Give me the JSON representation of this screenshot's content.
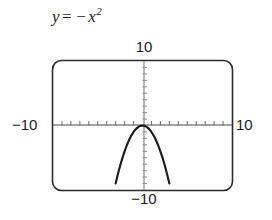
{
  "figure": {
    "kind": "graphing-calculator-viewing-window",
    "equation": {
      "lhs": "y",
      "operator": "=",
      "negative_sign": "−",
      "base": "x",
      "exponent": "2",
      "full": "y = −x²"
    },
    "labels": {
      "top": "10",
      "bottom": "−10",
      "left": "−10",
      "right": "10"
    },
    "colors": {
      "curve": "#1a1a1a",
      "frame": "#2b2b2b",
      "axis": "#4a4a4a",
      "tick": "#6d6d6d",
      "background": "#ffffff",
      "text": "#1c1c1c"
    }
  },
  "chart_data": {
    "type": "line",
    "xlabel": "",
    "ylabel": "",
    "xlim": [
      -10,
      10
    ],
    "ylim": [
      -10,
      10
    ],
    "grid": false,
    "legend": false,
    "x_tick_labels": [
      "−10",
      "10"
    ],
    "y_tick_labels": [
      "−10",
      "10"
    ],
    "x_tick_step": 1,
    "y_tick_step": 1,
    "series": [
      {
        "name": "y = −x²",
        "equation": "y = -x^2",
        "x": [
          -3.2,
          -3.0,
          -2.75,
          -2.5,
          -2.25,
          -2.0,
          -1.75,
          -1.5,
          -1.25,
          -1.0,
          -0.75,
          -0.5,
          -0.25,
          0,
          0.25,
          0.5,
          0.75,
          1.0,
          1.25,
          1.5,
          1.75,
          2.0,
          2.25,
          2.5,
          2.75,
          3.0,
          3.2
        ],
        "y": [
          -10.24,
          -9.0,
          -7.5625,
          -6.25,
          -5.0625,
          -4.0,
          -3.0625,
          -2.25,
          -1.5625,
          -1.0,
          -0.5625,
          -0.25,
          -0.0625,
          0,
          -0.0625,
          -0.25,
          -0.5625,
          -1.0,
          -1.5625,
          -2.25,
          -3.0625,
          -4.0,
          -5.0625,
          -6.25,
          -7.5625,
          -9.0,
          -10.24
        ],
        "vertex": [
          0,
          0
        ],
        "opens": "down"
      }
    ]
  }
}
